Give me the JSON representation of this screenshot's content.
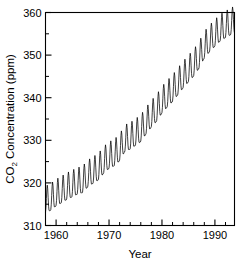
{
  "chart_data": {
    "type": "line",
    "title": "",
    "subtitle": "",
    "xlabel": "Year",
    "ylabel": "CO2 Concentration (ppm)",
    "ylabel_main": "CO",
    "ylabel_sub": "2",
    "ylabel_rest": " Concentration (ppm)",
    "xlim": [
      1958.0,
      1993.7
    ],
    "ylim": [
      310,
      360
    ],
    "x_major_ticks": [
      1960,
      1970,
      1980,
      1990
    ],
    "x_major_tick_labels": [
      "1960",
      "1970",
      "1980",
      "1990"
    ],
    "x_minor_tick_step": 2,
    "y_major_ticks": [
      310,
      320,
      330,
      340,
      350,
      360
    ],
    "y_major_tick_labels": [
      "310",
      "320",
      "330",
      "340",
      "350",
      "360"
    ],
    "y_minor_tick_step": 5,
    "grid": false,
    "legend": null,
    "legend_position": "none",
    "line_color": "#000000",
    "background_color": "#ffffff",
    "series": [
      {
        "name": "Atmospheric CO2 concentration (monthly, Mauna Loa)",
        "annual_mean_years": [
          1958,
          1959,
          1960,
          1961,
          1962,
          1963,
          1964,
          1965,
          1966,
          1967,
          1968,
          1969,
          1970,
          1971,
          1972,
          1973,
          1974,
          1975,
          1976,
          1977,
          1978,
          1979,
          1980,
          1981,
          1982,
          1983,
          1984,
          1985,
          1986,
          1987,
          1988,
          1989,
          1990,
          1991,
          1992,
          1993
        ],
        "annual_mean_values": [
          315.3,
          315.9,
          316.9,
          317.6,
          318.4,
          319.0,
          319.6,
          320.0,
          321.4,
          322.2,
          323.0,
          324.6,
          325.7,
          326.3,
          327.5,
          329.7,
          330.2,
          331.1,
          332.0,
          333.8,
          335.4,
          336.8,
          338.7,
          340.1,
          341.4,
          343.0,
          344.6,
          346.0,
          347.4,
          349.2,
          351.6,
          353.1,
          354.4,
          355.6,
          356.4,
          357.1
        ],
        "seasonal_amplitude_ppm": 3.1,
        "seasonal_peak_month": 5,
        "seasonal_trough_month": 10,
        "points_per_year": 12,
        "start_value": 315.3,
        "end_value": 358.2,
        "min_value": 313.2,
        "max_value": 358.4
      }
    ]
  },
  "axes": {
    "x_title": "Year",
    "y_title_prefix": "CO",
    "y_title_subscript": "2",
    "y_title_suffix": " Concentration (ppm)"
  }
}
